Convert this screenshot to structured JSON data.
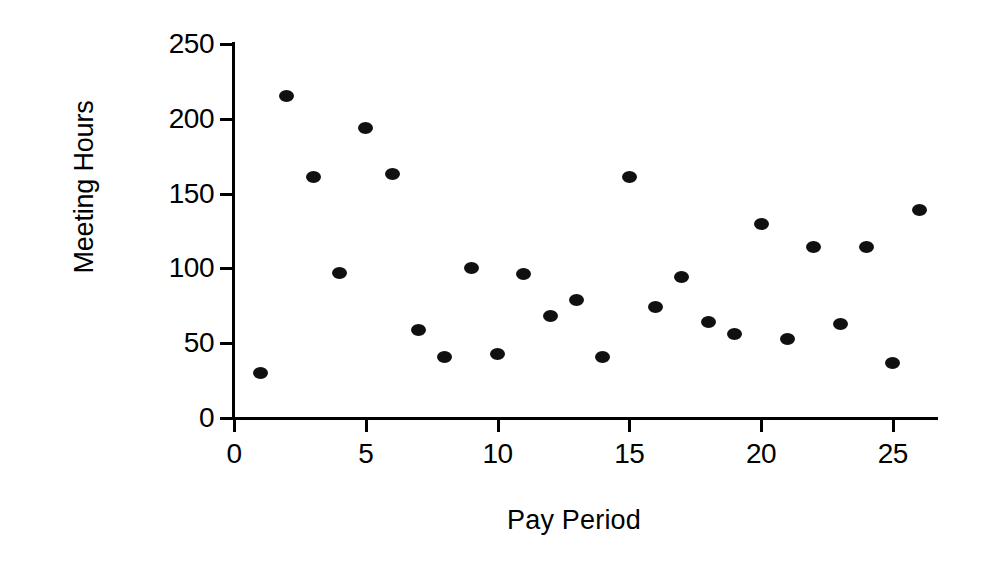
{
  "chart_data": {
    "type": "scatter",
    "title": "",
    "xlabel": "Pay Period",
    "ylabel": "Meeting Hours",
    "xlim": [
      0,
      26.8
    ],
    "ylim": [
      0,
      250
    ],
    "xticks": [
      0,
      5,
      10,
      15,
      20,
      25
    ],
    "yticks": [
      0,
      50,
      100,
      150,
      200,
      250
    ],
    "xtick_labels": [
      "0",
      "5",
      "10",
      "15",
      "20",
      "25"
    ],
    "ytick_labels": [
      "0",
      "50",
      "100",
      "150",
      "200",
      "250"
    ],
    "grid": false,
    "legend": "none",
    "marker": "filled-circle",
    "marker_color": "#101010",
    "x": [
      1,
      2,
      3,
      4,
      5,
      6,
      7,
      8,
      9,
      10,
      11,
      12,
      13,
      14,
      15,
      16,
      17,
      18,
      19,
      20,
      21,
      22,
      23,
      24,
      25,
      26
    ],
    "y": [
      30,
      215,
      161,
      97,
      194,
      163,
      59,
      41,
      100,
      43,
      96,
      68,
      79,
      41,
      161,
      74,
      94,
      64,
      56,
      130,
      53,
      114,
      63,
      114,
      37,
      139
    ],
    "points": [
      {
        "x": 1,
        "y": 30
      },
      {
        "x": 2,
        "y": 215
      },
      {
        "x": 3,
        "y": 161
      },
      {
        "x": 4,
        "y": 97
      },
      {
        "x": 5,
        "y": 194
      },
      {
        "x": 6,
        "y": 163
      },
      {
        "x": 7,
        "y": 59
      },
      {
        "x": 8,
        "y": 41
      },
      {
        "x": 9,
        "y": 100
      },
      {
        "x": 10,
        "y": 43
      },
      {
        "x": 11,
        "y": 96
      },
      {
        "x": 12,
        "y": 68
      },
      {
        "x": 13,
        "y": 79
      },
      {
        "x": 14,
        "y": 41
      },
      {
        "x": 15,
        "y": 161
      },
      {
        "x": 16,
        "y": 74
      },
      {
        "x": 17,
        "y": 94
      },
      {
        "x": 18,
        "y": 64
      },
      {
        "x": 19,
        "y": 56
      },
      {
        "x": 20,
        "y": 130
      },
      {
        "x": 21,
        "y": 53
      },
      {
        "x": 22,
        "y": 114
      },
      {
        "x": 23,
        "y": 63
      },
      {
        "x": 24,
        "y": 114
      },
      {
        "x": 25,
        "y": 37
      },
      {
        "x": 26,
        "y": 139
      }
    ]
  },
  "axes": {
    "y_title": "Meeting Hours",
    "x_title": "Pay Period"
  },
  "colors": {
    "background": "#ffffff",
    "foreground": "#000000",
    "marker": "#101010"
  }
}
